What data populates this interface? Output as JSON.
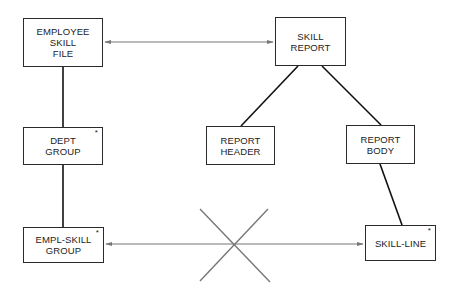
{
  "diagram": {
    "type": "data-structure-correspondence",
    "nodes": [
      {
        "id": "employee-skill-file",
        "label": "EMPLOYEE\nSKILL\nFILE",
        "repeating": false
      },
      {
        "id": "dept-group",
        "label": "DEPT\nGROUP",
        "repeating": true
      },
      {
        "id": "empl-skill-group",
        "label": "EMPL-SKILL\nGROUP",
        "repeating": true
      },
      {
        "id": "skill-report",
        "label": "SKILL\nREPORT",
        "repeating": false
      },
      {
        "id": "report-header",
        "label": "REPORT\nHEADER",
        "repeating": false
      },
      {
        "id": "report-body",
        "label": "REPORT\nBODY",
        "repeating": false
      },
      {
        "id": "skill-line",
        "label": "SKILL-LINE",
        "repeating": true
      }
    ],
    "repeat_marker": "*",
    "edges": [
      {
        "from": "employee-skill-file",
        "to": "dept-group",
        "kind": "hierarchy"
      },
      {
        "from": "dept-group",
        "to": "empl-skill-group",
        "kind": "hierarchy"
      },
      {
        "from": "skill-report",
        "to": "report-header",
        "kind": "hierarchy"
      },
      {
        "from": "skill-report",
        "to": "report-body",
        "kind": "hierarchy"
      },
      {
        "from": "report-body",
        "to": "skill-line",
        "kind": "hierarchy"
      },
      {
        "from": "employee-skill-file",
        "to": "skill-report",
        "kind": "correspondence"
      },
      {
        "from": "empl-skill-group",
        "to": "skill-line",
        "kind": "correspondence",
        "crossed_out": true
      }
    ],
    "colors": {
      "box_border": "#2a2a2a",
      "hierarchy_line": "#111111",
      "arrow_line": "#777777",
      "cross": "#777777"
    }
  }
}
